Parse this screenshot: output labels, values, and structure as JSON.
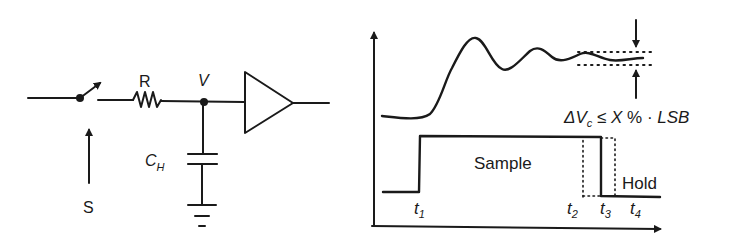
{
  "circuit": {
    "switch_label": "S",
    "resistor_label": "R",
    "node_label": "V",
    "capacitor_label": "C",
    "capacitor_subscript": "H"
  },
  "timing": {
    "settling_condition": {
      "delta": "ΔV",
      "delta_sub": "c",
      "relation": " ≤ ",
      "x": "X",
      "rest": " % · ",
      "lsb": "LSB"
    },
    "phase_sample": "Sample",
    "phase_hold": "Hold",
    "time_marks": [
      {
        "t": "t",
        "sub": "1"
      },
      {
        "t": "t",
        "sub": "2"
      },
      {
        "t": "t",
        "sub": "3"
      },
      {
        "t": "t",
        "sub": "4"
      }
    ]
  },
  "colors": {
    "ink": "#1a1a1a",
    "background": "#ffffff"
  }
}
